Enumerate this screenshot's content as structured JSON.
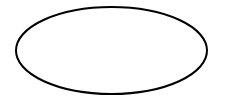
{
  "diagram": {
    "shapes": [
      {
        "type": "ellipse",
        "cx": 111.5,
        "cy": 50.5,
        "rx": 95.5,
        "ry": 43.5,
        "stroke": "#000000",
        "stroke_width": 2,
        "fill": "#ffffff",
        "label": ""
      }
    ]
  },
  "colors": {
    "background": "#ffffff",
    "stroke": "#000000"
  }
}
